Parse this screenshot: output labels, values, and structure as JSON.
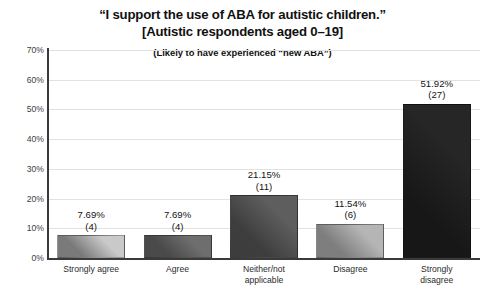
{
  "chart_data": {
    "type": "bar",
    "title": "“I support the use of ABA for autistic children.”",
    "title_line2": "[Autistic respondents aged 0–19]",
    "subtitle": "(Likely to have experienced “new ABA”)",
    "xlabel": "",
    "ylabel": "",
    "ylim": [
      0,
      70
    ],
    "grid": true,
    "legend": "none",
    "ytick_labels": [
      "70%",
      "60%",
      "50%",
      "40%",
      "30%",
      "20%",
      "10%",
      "0%"
    ],
    "ytick_values": [
      70,
      60,
      50,
      40,
      30,
      20,
      10,
      0
    ],
    "categories": [
      "Strongly agree",
      "Agree",
      "Neither/not applicable",
      "Disagree",
      "Strongly disagree"
    ],
    "category_lines": [
      [
        "Strongly agree"
      ],
      [
        "Agree"
      ],
      [
        "Neither/not",
        "applicable"
      ],
      [
        "Disagree"
      ],
      [
        "Strongly",
        "disagree"
      ]
    ],
    "values": [
      7.69,
      7.69,
      21.15,
      11.54,
      51.92
    ],
    "counts": [
      4,
      4,
      11,
      6,
      27
    ],
    "value_labels": [
      "7.69%",
      "7.69%",
      "21.15%",
      "11.54%",
      "51.92%"
    ],
    "count_labels": [
      "(4)",
      "(4)",
      "(11)",
      "(6)",
      "(27)"
    ],
    "bar_colors": [
      "#c9c9c9",
      "#6e6e6e",
      "#5e5e5e",
      "#b5b5b5",
      "#262626"
    ],
    "bar_colors_dark": [
      "#7a7a7a",
      "#4a4a4a",
      "#3d3d3d",
      "#7e7e7e",
      "#171717"
    ],
    "total_responses": 52,
    "grid_color": "#e2e2e2",
    "axis_color": "#3a3a3a",
    "background": "#ffffff"
  }
}
